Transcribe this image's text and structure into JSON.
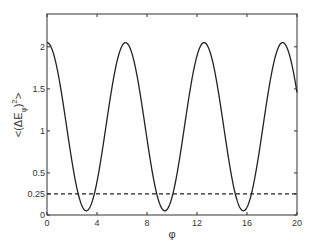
{
  "chart_data": {
    "type": "line",
    "title": "",
    "xlabel": "φ",
    "ylabel": "<(ΔE_φ)²>",
    "ylabel_parts": {
      "open": "<(ΔE",
      "sub": "φ",
      "close": ")",
      "sup": "2",
      "end": ">"
    },
    "xlim": [
      0,
      20
    ],
    "ylim": [
      0,
      2.39
    ],
    "xticks": [
      0,
      4,
      8,
      12,
      16,
      20
    ],
    "xtick_labels": [
      "0",
      "4",
      "8",
      "12",
      "16",
      "20"
    ],
    "yticks": [
      0,
      0.25,
      0.5,
      1,
      1.5,
      2
    ],
    "ytick_labels": [
      "0",
      "0.25",
      "0.5",
      "1",
      "1.5",
      "2"
    ],
    "grid": false,
    "legend": null,
    "series": [
      {
        "name": "variance",
        "style": "solid",
        "color": "#222222",
        "formula": "1.05 + cos(phi)",
        "x": [
          0,
          1,
          2,
          3,
          3.14,
          4,
          5,
          6,
          6.28,
          7,
          8,
          9,
          9.42,
          10,
          11,
          12,
          12.57,
          13,
          14,
          15,
          15.71,
          16,
          17,
          18,
          18.85,
          19,
          20
        ],
        "values": [
          2.05,
          1.59,
          0.63,
          0.06,
          0.05,
          0.4,
          1.33,
          2.01,
          2.05,
          1.8,
          0.9,
          0.14,
          0.05,
          0.21,
          1.05,
          1.89,
          2.05,
          1.96,
          1.19,
          0.29,
          0.05,
          0.09,
          0.77,
          1.71,
          2.05,
          2.04,
          1.46
        ]
      },
      {
        "name": "threshold",
        "style": "dashed",
        "color": "#222222",
        "x": [
          0,
          20
        ],
        "values": [
          0.25,
          0.25
        ]
      }
    ]
  }
}
